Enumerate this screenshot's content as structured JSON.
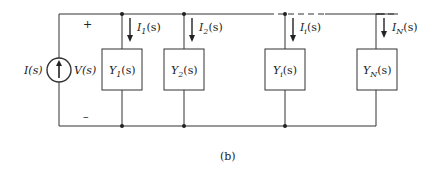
{
  "diagram": {
    "source": {
      "current_label": "I(s)",
      "voltage_label": "V(s)",
      "plus": "+",
      "minus": "–"
    },
    "branches": [
      {
        "admittance": "Y",
        "adm_sub": "1",
        "current": "I",
        "cur_sub": "1"
      },
      {
        "admittance": "Y",
        "adm_sub": "2",
        "current": "I",
        "cur_sub": "2"
      },
      {
        "admittance": "Y",
        "adm_sub": "i",
        "current": "I",
        "cur_sub": "i"
      },
      {
        "admittance": "Y",
        "adm_sub": "N",
        "current": "I",
        "cur_sub": "N"
      }
    ],
    "arg": "(s)",
    "caption": "(b)"
  }
}
